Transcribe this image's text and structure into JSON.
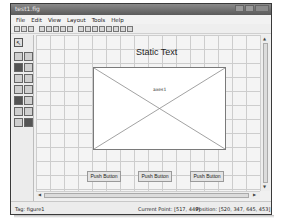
{
  "window": {
    "title": "test1.fig",
    "controls": [
      "minimize",
      "maximize",
      "close"
    ]
  },
  "menubar": {
    "items": [
      "File",
      "Edit",
      "View",
      "Layout",
      "Tools",
      "Help"
    ]
  },
  "toolbar": {
    "buttons": [
      "new",
      "open",
      "save",
      "cut",
      "copy",
      "paste",
      "undo",
      "redo",
      "align",
      "menu-editor",
      "tab-order",
      "toolbar-editor",
      "m-file-editor",
      "property-inspector",
      "object-browser",
      "run"
    ]
  },
  "palette": {
    "select_tool": "arrow-select",
    "components": [
      "push-button",
      "slider",
      "radio-button",
      "check-box",
      "edit-text",
      "static-text",
      "popup-menu",
      "listbox",
      "toggle-button",
      "table",
      "axes",
      "panel",
      "button-group",
      "activex"
    ]
  },
  "canvas": {
    "static_text": "Static Text",
    "axes_label": "axes1",
    "buttons": [
      {
        "label": "Push Button"
      },
      {
        "label": "Push Button"
      },
      {
        "label": "Push Button"
      }
    ]
  },
  "statusbar": {
    "tag": "Tag: figure1",
    "current_point": "Current Point: [517, 449]",
    "position": "Position: [520, 347, 645, 453]"
  },
  "colors": {
    "titlebar": "#6a6a6a",
    "grid": "#cdcdcd",
    "canvas_bg": "#f4f4f4"
  }
}
